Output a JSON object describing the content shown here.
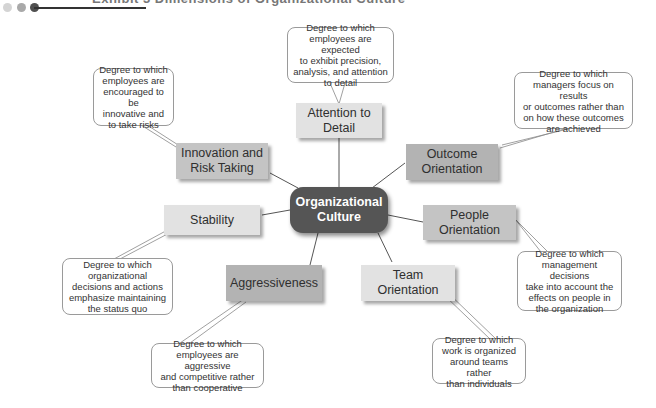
{
  "header": {
    "title": "Exhibit 3 Dimensions of Organizational Culture",
    "dots": [
      "#cfcfcf",
      "#a9a9a9",
      "#555555"
    ]
  },
  "center": {
    "label_line1": "Organizational",
    "label_line2": "Culture"
  },
  "dimensions": [
    {
      "id": "attention",
      "line1": "Attention to",
      "line2": "Detail",
      "description": [
        "Degree to which",
        "employees are expected",
        "to exhibit precision,",
        "analysis, and attention",
        "to detail"
      ]
    },
    {
      "id": "outcome",
      "line1": "Outcome",
      "line2": "Orientation",
      "description": [
        "Degree to which",
        "managers focus on results",
        "or outcomes rather than",
        "on how these outcomes",
        "are achieved"
      ]
    },
    {
      "id": "people",
      "line1": "People",
      "line2": "Orientation",
      "description": [
        "Degree to which",
        "management decisions",
        "take into account the",
        "effects on people in",
        "the organization"
      ]
    },
    {
      "id": "team",
      "line1": "Team",
      "line2": "Orientation",
      "description": [
        "Degree to which",
        "work is organized",
        "around teams rather",
        "than individuals"
      ]
    },
    {
      "id": "aggressiveness",
      "line1": "Aggressiveness",
      "line2": "",
      "description": [
        "Degree to which",
        "employees are aggressive",
        "and competitive rather",
        "than cooperative"
      ]
    },
    {
      "id": "stability",
      "line1": "Stability",
      "line2": "",
      "description": [
        "Degree to which",
        "organizational",
        "decisions and actions",
        "emphasize maintaining",
        "the status quo"
      ]
    },
    {
      "id": "innovation",
      "line1": "Innovation and",
      "line2": "Risk Taking",
      "description": [
        "Degree to which",
        "employees are",
        "encouraged to be",
        "innovative and",
        "to take risks"
      ]
    }
  ]
}
